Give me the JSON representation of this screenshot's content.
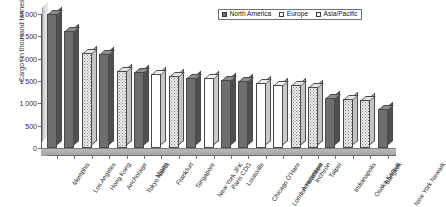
{
  "chart_data": {
    "type": "bar",
    "title": "",
    "xlabel": "",
    "ylabel": "Cargo (in thousand tonnes)",
    "ylim": [
      0,
      3000
    ],
    "yticks": [
      0,
      500,
      1000,
      1500,
      2000,
      2500,
      3000
    ],
    "ytick_labels": [
      "0",
      "500",
      "1 000",
      "1 500",
      "2 000",
      "2 500",
      "3 000"
    ],
    "grid": false,
    "legend_position": "top-right",
    "legend": [
      "North America",
      "Europe",
      "Asia/Pacific"
    ],
    "series_colors": {
      "North America": "#6e6e6e",
      "Europe": "#ffffff",
      "Asia/Pacific": "#f2f2f2"
    },
    "categories": [
      "Memphis",
      "Los Angeles",
      "Hong Kong",
      "Anchorage",
      "Tokyo Narita",
      "Miami",
      "Frankfurt",
      "Singapore",
      "New York JFK",
      "Paris CDG",
      "Louisville",
      "Chicago O'Hare",
      "London Heathrow",
      "Amsterdam",
      "Incheon",
      "Taipei",
      "Indianapolis",
      "Osaka Kansai",
      "Bangkok",
      "New York Newark"
    ],
    "values": [
      3000,
      2620,
      2120,
      2110,
      1720,
      1700,
      1660,
      1620,
      1560,
      1560,
      1520,
      1500,
      1450,
      1420,
      1400,
      1370,
      1120,
      1090,
      1080,
      880
    ],
    "point_series": [
      "North America",
      "North America",
      "Asia/Pacific",
      "North America",
      "Asia/Pacific",
      "North America",
      "Europe",
      "Asia/Pacific",
      "North America",
      "Europe",
      "North America",
      "North America",
      "Europe",
      "Europe",
      "Asia/Pacific",
      "Asia/Pacific",
      "North America",
      "Asia/Pacific",
      "Asia/Pacific",
      "North America"
    ]
  }
}
